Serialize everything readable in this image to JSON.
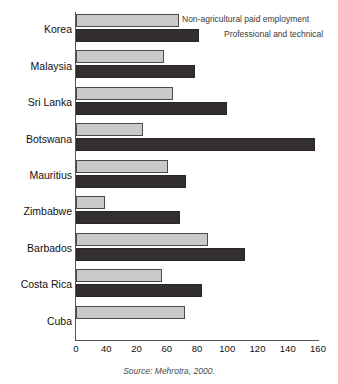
{
  "chart_data": {
    "type": "bar",
    "orientation": "horizontal",
    "title": "",
    "xlabel": "",
    "ylabel": "",
    "xlim": [
      0,
      160
    ],
    "xticks": [
      0,
      40,
      20,
      60,
      80,
      100,
      120,
      140,
      160
    ],
    "grid": false,
    "legend_position": "top-right",
    "categories": [
      "Korea",
      "Malaysia",
      "Sri Lanka",
      "Botswana",
      "Mauritius",
      "Zimbabwe",
      "Barbados",
      "Costa Rica",
      "Cuba"
    ],
    "series": [
      {
        "name": "Non-agricultural paid employment",
        "color": "#c9c9c9",
        "values": [
          68,
          58,
          64,
          44,
          61,
          19,
          87,
          57,
          72
        ]
      },
      {
        "name": "Professional and technical",
        "color": "#332f2f",
        "values": [
          81,
          79,
          100,
          158,
          73,
          69,
          112,
          83,
          null
        ]
      }
    ],
    "source": "Source: Mehrotra, 2000.",
    "source_prefix": "Source:",
    "source_reference": "Mehrotra, 2000."
  }
}
